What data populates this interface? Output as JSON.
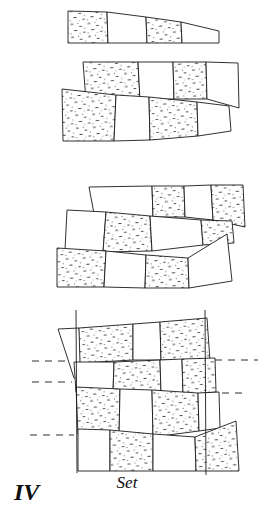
{
  "figure": {
    "label": "IV",
    "caption": "Set",
    "colors": {
      "ink": "#1a1a1a",
      "background": "#ffffff",
      "stipple_fill": "#ffffff",
      "stipple_dot": "#333333"
    },
    "legend": {
      "stippled_block": "stippled",
      "plain_block": "plain"
    },
    "guides": {
      "vertical_count": 2,
      "dashed_count": 3
    },
    "panels": [
      {
        "id": "panel-1",
        "rows": 1,
        "block_count": 4,
        "fills": [
          "stippled",
          "plain",
          "stippled",
          "plain"
        ]
      },
      {
        "id": "panel-2",
        "rows": 2,
        "block_count": 8,
        "fills": [
          "stippled",
          "plain",
          "stippled",
          "plain",
          "stippled",
          "plain",
          "stippled",
          "plain"
        ]
      },
      {
        "id": "panel-3",
        "rows": 3,
        "block_count": 12,
        "fills": [
          "plain",
          "stippled",
          "plain",
          "stippled",
          "plain",
          "stippled",
          "plain",
          "stippled",
          "stippled",
          "plain",
          "stippled",
          "plain"
        ]
      },
      {
        "id": "panel-4",
        "rows": 4,
        "block_count": 16,
        "fills": [
          "plain",
          "stippled",
          "plain",
          "stippled",
          "plain",
          "stippled",
          "plain",
          "stippled",
          "stippled",
          "plain",
          "stippled",
          "plain",
          "plain",
          "stippled",
          "plain",
          "stippled"
        ]
      }
    ]
  }
}
